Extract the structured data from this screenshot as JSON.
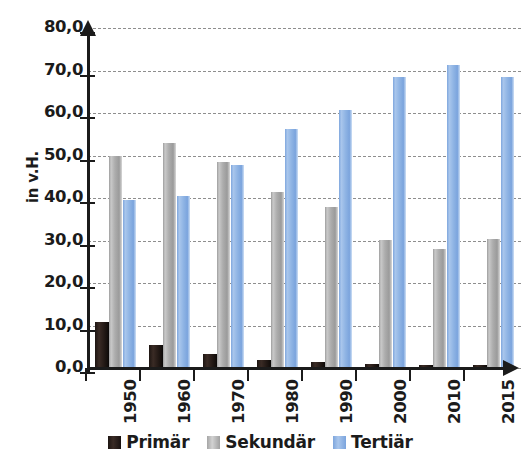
{
  "chart_data": {
    "type": "bar",
    "title": "",
    "xlabel": "",
    "ylabel": "in v.H.",
    "ylim": [
      0,
      80
    ],
    "ytick_step": 10,
    "grid": true,
    "legend_position": "bottom",
    "categories": [
      "1950",
      "1960",
      "1970",
      "1980",
      "1990",
      "2000",
      "2010",
      "2015"
    ],
    "ytick_labels": [
      "0,0",
      "10,0",
      "20,0",
      "30,0",
      "40,0",
      "50,0",
      "60,0",
      "70,0",
      "80,0"
    ],
    "series": [
      {
        "name": "Primär",
        "color": "#241a16",
        "values": [
          10.8,
          5.5,
          3.2,
          2.0,
          1.4,
          1.0,
          0.8,
          0.7
        ]
      },
      {
        "name": "Sekundär",
        "color": "#adadad",
        "values": [
          49.9,
          53.0,
          48.5,
          41.5,
          37.8,
          30.2,
          28.0,
          30.4
        ]
      },
      {
        "name": "Tertiär",
        "color": "#8fb4e4",
        "values": [
          39.6,
          40.5,
          47.8,
          56.2,
          60.6,
          68.4,
          71.2,
          68.5
        ]
      }
    ]
  },
  "axis": {
    "y_label": "in v.H."
  },
  "legend": {
    "items": [
      {
        "label": "Primär"
      },
      {
        "label": "Sekundär"
      },
      {
        "label": "Tertiär"
      }
    ]
  }
}
